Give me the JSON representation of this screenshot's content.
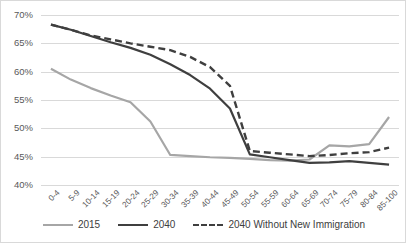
{
  "chart_data": {
    "type": "line",
    "title": "",
    "xlabel": "",
    "ylabel": "",
    "grid": true,
    "legend_position": "bottom",
    "ylim": [
      40,
      70
    ],
    "ytick_labels": [
      "70%",
      "65%",
      "60%",
      "55%",
      "50%",
      "45%",
      "40%"
    ],
    "ytick_values": [
      70,
      65,
      60,
      55,
      50,
      45,
      40
    ],
    "categories": [
      "0-4",
      "5-9",
      "10-14",
      "15-19",
      "20-24",
      "25-29",
      "30-34",
      "35-39",
      "40-44",
      "45-49",
      "50-54",
      "55-59",
      "60-64",
      "65-69",
      "70-74",
      "75-79",
      "80-84",
      "85-100"
    ],
    "series": [
      {
        "name": "2015",
        "color": "#a6a6a6",
        "style": "solid",
        "values": [
          60.5,
          58.6,
          57.1,
          55.8,
          54.6,
          51.2,
          45.3,
          45.1,
          44.9,
          44.8,
          44.6,
          44.4,
          44.3,
          44.5,
          47.0,
          46.8,
          47.2,
          52.0
        ]
      },
      {
        "name": "2040",
        "color": "#3f3f3f",
        "style": "solid",
        "values": [
          68.3,
          67.4,
          66.3,
          65.2,
          64.2,
          63.0,
          61.3,
          59.4,
          57.0,
          53.5,
          45.4,
          44.9,
          44.4,
          43.9,
          44.0,
          44.2,
          43.9,
          43.6
        ]
      },
      {
        "name": "2040 Without New Immigration",
        "color": "#3f3f3f",
        "style": "dashed",
        "values": [
          68.3,
          67.4,
          66.4,
          65.7,
          65.0,
          64.4,
          63.8,
          62.6,
          60.8,
          57.5,
          46.0,
          45.7,
          45.4,
          45.1,
          45.3,
          45.6,
          45.8,
          46.6
        ]
      }
    ]
  },
  "legend": {
    "items": [
      {
        "label": "2015"
      },
      {
        "label": "2040"
      },
      {
        "label": "2040 Without New Immigration"
      }
    ]
  }
}
